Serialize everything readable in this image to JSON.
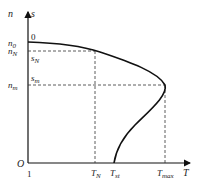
{
  "diagram": {
    "type": "motor torque-speed characteristic",
    "axes": {
      "y_label_n": "n",
      "y_label_s": "s",
      "x_label": "T",
      "origin": "O",
      "s_at_origin": "1"
    },
    "y_ticks": [
      {
        "main": "n",
        "sub": "0",
        "s_main": "0",
        "s_sub": ""
      },
      {
        "main": "n",
        "sub": "N",
        "s_main": "s",
        "s_sub": "N"
      },
      {
        "main": "n",
        "sub": "m",
        "s_main": "s",
        "s_sub": "m"
      }
    ],
    "x_ticks": [
      {
        "main": "T",
        "sub": "N"
      },
      {
        "main": "T",
        "sub": "st"
      },
      {
        "main": "T",
        "sub": "max"
      }
    ],
    "colors": {
      "curve": "#111111",
      "dashed": "#333333",
      "axis": "#111111"
    }
  }
}
